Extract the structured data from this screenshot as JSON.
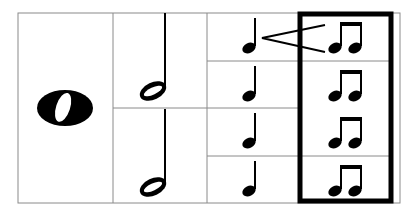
{
  "diagram": {
    "columns": [
      {
        "label": "whole note",
        "count": 1,
        "symbol": "whole-note"
      },
      {
        "label": "half notes",
        "count": 2,
        "symbol": "half-note"
      },
      {
        "label": "quarter notes",
        "count": 4,
        "symbol": "quarter-note"
      },
      {
        "label": "eighth notes (beamed pairs)",
        "count": 4,
        "symbol": "eighth-note-pair"
      }
    ],
    "highlighted_column": "eighth notes (beamed pairs)",
    "annotation": "quarter note splits into two eighth notes",
    "colors": {
      "grid": "#8a8a8a",
      "ink": "#000000",
      "background": "#ffffff"
    }
  }
}
